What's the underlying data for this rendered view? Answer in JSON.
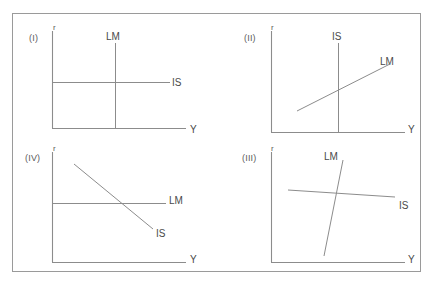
{
  "figure": {
    "background_color": "#ffffff",
    "border_color": "#9a9a9a",
    "line_color": "#8c8c8c",
    "text_color": "#4a4a4a"
  },
  "panels": [
    {
      "id": "panel-1",
      "label": "(I)",
      "y_axis_label": "r",
      "x_axis_label": "Y",
      "curves": [
        {
          "name": "LM",
          "label": "LM",
          "shape": "vertical"
        },
        {
          "name": "IS",
          "label": "IS",
          "shape": "horizontal"
        }
      ]
    },
    {
      "id": "panel-2",
      "label": "(II)",
      "y_axis_label": "r",
      "x_axis_label": "Y",
      "curves": [
        {
          "name": "IS",
          "label": "IS",
          "shape": "vertical"
        },
        {
          "name": "LM",
          "label": "LM",
          "shape": "upward-sloping"
        }
      ]
    },
    {
      "id": "panel-4",
      "label": "(IV)",
      "y_axis_label": "r",
      "x_axis_label": "Y",
      "curves": [
        {
          "name": "LM",
          "label": "LM",
          "shape": "horizontal"
        },
        {
          "name": "IS",
          "label": "IS",
          "shape": "downward-sloping"
        }
      ]
    },
    {
      "id": "panel-3",
      "label": "(III)",
      "y_axis_label": "r",
      "x_axis_label": "Y",
      "curves": [
        {
          "name": "LM",
          "label": "LM",
          "shape": "steep-upward-sloping"
        },
        {
          "name": "IS",
          "label": "IS",
          "shape": "shallow-downward-sloping"
        }
      ]
    }
  ]
}
